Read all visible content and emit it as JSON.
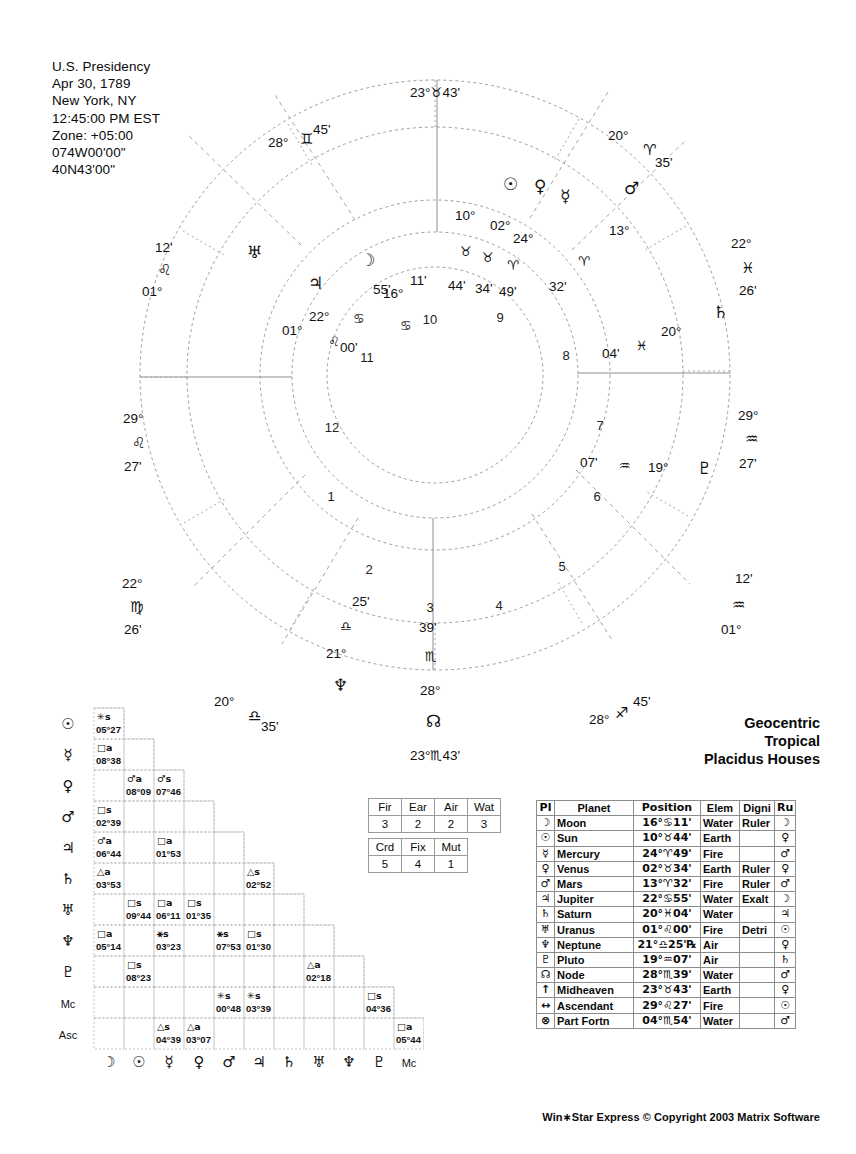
{
  "header": {
    "lines": [
      "U.S. Presidency",
      "Apr 30, 1789",
      "New York, NY",
      "12:45:00 PM EST",
      "Zone: +05:00",
      "074W00'00\"",
      "40N43'00\""
    ]
  },
  "chart_type": {
    "line1": "Geocentric",
    "line2": "Tropical",
    "line3": "Placidus Houses"
  },
  "footer": {
    "text": "Win∗Star Express  © Copyright 2003 Matrix Software"
  },
  "wheel": {
    "house_numbers": [
      "1",
      "2",
      "3",
      "4",
      "5",
      "6",
      "7",
      "8",
      "9",
      "10",
      "11",
      "12"
    ],
    "cusps": [
      {
        "house": "1",
        "deg": "29°",
        "sign": "♌",
        "min": "27'",
        "label": "29°♌27'"
      },
      {
        "house": "2",
        "deg": "22°",
        "sign": "♍",
        "min": "26'",
        "label": "22°♍26'"
      },
      {
        "house": "3",
        "deg": "20°",
        "sign": "♎",
        "min": "35'",
        "label": "20°♎35'"
      },
      {
        "house": "4",
        "deg": "23°",
        "sign": "♏",
        "min": "43'",
        "label": "23°♏43'"
      },
      {
        "house": "5",
        "deg": "28°",
        "sign": "♐",
        "min": "45'",
        "label": "28°♐45'"
      },
      {
        "house": "6",
        "deg": "01°",
        "sign": "♒",
        "min": "12'",
        "label": "01°♒12'"
      },
      {
        "house": "7",
        "deg": "29°",
        "sign": "♒",
        "min": "27'",
        "label": "29°♒27'"
      },
      {
        "house": "8",
        "deg": "22°",
        "sign": "♓",
        "min": "26'",
        "label": "22°♓26'"
      },
      {
        "house": "9",
        "deg": "20°",
        "sign": "♈",
        "min": "35'",
        "label": "20°♈35'"
      },
      {
        "house": "10",
        "deg": "23°",
        "sign": "♉",
        "min": "43'",
        "label": "23°♉43'"
      },
      {
        "house": "11",
        "deg": "28°",
        "sign": "♊",
        "min": "45'",
        "label": "28°♊45'"
      },
      {
        "house": "12",
        "deg": "01°",
        "sign": "♌",
        "min": "12'",
        "label": "01°♌12'"
      }
    ],
    "planets": [
      {
        "glyph": "☽",
        "deg": "16°",
        "sign": "♋",
        "min": "11'"
      },
      {
        "glyph": "☉",
        "deg": "10°",
        "sign": "♉",
        "min": "44'"
      },
      {
        "glyph": "☿",
        "deg": "24°",
        "sign": "♈",
        "min": "49'"
      },
      {
        "glyph": "♀",
        "deg": "02°",
        "sign": "♉",
        "min": "34'"
      },
      {
        "glyph": "♂",
        "deg": "13°",
        "sign": "♈",
        "min": "32'"
      },
      {
        "glyph": "♃",
        "deg": "22°",
        "sign": "♋",
        "min": "55'"
      },
      {
        "glyph": "♄",
        "deg": "20°",
        "sign": "♓",
        "min": "04'"
      },
      {
        "glyph": "♅",
        "deg": "01°",
        "sign": "♌",
        "min": "00'"
      },
      {
        "glyph": "♆",
        "deg": "21°",
        "sign": "♎",
        "min": "25'"
      },
      {
        "glyph": "♇",
        "deg": "19°",
        "sign": "♒",
        "min": "07'"
      },
      {
        "glyph": "☊",
        "deg": "28°",
        "sign": "♏",
        "min": "39'"
      }
    ]
  },
  "elements_table": {
    "headers": [
      "Fir",
      "Ear",
      "Air",
      "Wat"
    ],
    "values": [
      "3",
      "2",
      "2",
      "3"
    ]
  },
  "modes_table": {
    "headers": [
      "Crd",
      "Fix",
      "Mut"
    ],
    "values": [
      "5",
      "4",
      "1"
    ]
  },
  "planet_table": {
    "headers": [
      "Pl",
      "Planet",
      "Position",
      "Elem",
      "Digni",
      "Ru"
    ],
    "rows": [
      {
        "glyph": "☽",
        "name": "Moon",
        "position": "16°♋11'",
        "elem": "Water",
        "digni": "Ruler",
        "ruler": "☽"
      },
      {
        "glyph": "☉",
        "name": "Sun",
        "position": "10°♉44'",
        "elem": "Earth",
        "digni": "",
        "ruler": "♀"
      },
      {
        "glyph": "☿",
        "name": "Mercury",
        "position": "24°♈49'",
        "elem": "Fire",
        "digni": "",
        "ruler": "♂"
      },
      {
        "glyph": "♀",
        "name": "Venus",
        "position": "02°♉34'",
        "elem": "Earth",
        "digni": "Ruler",
        "ruler": "♀"
      },
      {
        "glyph": "♂",
        "name": "Mars",
        "position": "13°♈32'",
        "elem": "Fire",
        "digni": "Ruler",
        "ruler": "♂"
      },
      {
        "glyph": "♃",
        "name": "Jupiter",
        "position": "22°♋55'",
        "elem": "Water",
        "digni": "Exalt",
        "ruler": "☽"
      },
      {
        "glyph": "♄",
        "name": "Saturn",
        "position": "20°♓04'",
        "elem": "Water",
        "digni": "",
        "ruler": "♃"
      },
      {
        "glyph": "♅",
        "name": "Uranus",
        "position": "01°♌00'",
        "elem": "Fire",
        "digni": "Detri",
        "ruler": "☉"
      },
      {
        "glyph": "♆",
        "name": "Neptune",
        "position": "21°♎25'℞",
        "elem": "Air",
        "digni": "",
        "ruler": "♀"
      },
      {
        "glyph": "♇",
        "name": "Pluto",
        "position": "19°♒07'",
        "elem": "Air",
        "digni": "",
        "ruler": "♄"
      },
      {
        "glyph": "☊",
        "name": "Node",
        "position": "28°♏39'",
        "elem": "Water",
        "digni": "",
        "ruler": "♂"
      },
      {
        "glyph": "↑",
        "name": "Midheaven",
        "position": "23°♉43'",
        "elem": "Earth",
        "digni": "",
        "ruler": "♀"
      },
      {
        "glyph": "↔",
        "name": "Ascendant",
        "position": "29°♌27'",
        "elem": "Fire",
        "digni": "",
        "ruler": "☉"
      },
      {
        "glyph": "⊗",
        "name": "Part Fortn",
        "position": "04°♏54'",
        "elem": "Water",
        "digni": "",
        "ruler": "♂"
      }
    ]
  },
  "aspect_grid": {
    "row_labels": [
      "☉",
      "☿",
      "♀",
      "♂",
      "♃",
      "♄",
      "♅",
      "♆",
      "♇",
      "Mc",
      "Asc"
    ],
    "col_labels": [
      "☽",
      "☉",
      "☿",
      "♀",
      "♂",
      "♃",
      "♄",
      "♅",
      "♆",
      "♇",
      "Mc"
    ],
    "cells": [
      {
        "row": 0,
        "col": 0,
        "aspect": "✳s",
        "orb": "05°27"
      },
      {
        "row": 1,
        "col": 0,
        "aspect": "□a",
        "orb": "08°38"
      },
      {
        "row": 2,
        "col": 1,
        "aspect": "♂a",
        "orb": "08°09"
      },
      {
        "row": 2,
        "col": 2,
        "aspect": "♂s",
        "orb": "07°46"
      },
      {
        "row": 3,
        "col": 0,
        "aspect": "□s",
        "orb": "02°39"
      },
      {
        "row": 4,
        "col": 0,
        "aspect": "♂a",
        "orb": "06°44"
      },
      {
        "row": 4,
        "col": 2,
        "aspect": "□a",
        "orb": "01°53"
      },
      {
        "row": 5,
        "col": 0,
        "aspect": "△a",
        "orb": "03°53"
      },
      {
        "row": 5,
        "col": 5,
        "aspect": "△s",
        "orb": "02°52"
      },
      {
        "row": 6,
        "col": 1,
        "aspect": "□s",
        "orb": "09°44"
      },
      {
        "row": 6,
        "col": 2,
        "aspect": "□a",
        "orb": "06°11"
      },
      {
        "row": 6,
        "col": 3,
        "aspect": "□s",
        "orb": "01°35"
      },
      {
        "row": 7,
        "col": 0,
        "aspect": "□a",
        "orb": "05°14"
      },
      {
        "row": 7,
        "col": 2,
        "aspect": "⚹s",
        "orb": "03°23"
      },
      {
        "row": 7,
        "col": 4,
        "aspect": "⚹s",
        "orb": "07°53"
      },
      {
        "row": 7,
        "col": 5,
        "aspect": "□s",
        "orb": "01°30"
      },
      {
        "row": 8,
        "col": 1,
        "aspect": "□s",
        "orb": "08°23"
      },
      {
        "row": 8,
        "col": 7,
        "aspect": "△a",
        "orb": "02°18"
      },
      {
        "row": 9,
        "col": 4,
        "aspect": "✳s",
        "orb": "00°48"
      },
      {
        "row": 9,
        "col": 5,
        "aspect": "✳s",
        "orb": "03°39"
      },
      {
        "row": 9,
        "col": 9,
        "aspect": "□s",
        "orb": "04°36"
      },
      {
        "row": 10,
        "col": 2,
        "aspect": "△s",
        "orb": "04°39"
      },
      {
        "row": 10,
        "col": 3,
        "aspect": "△a",
        "orb": "03°07"
      },
      {
        "row": 10,
        "col": 10,
        "aspect": "□a",
        "orb": "05°44"
      }
    ]
  }
}
